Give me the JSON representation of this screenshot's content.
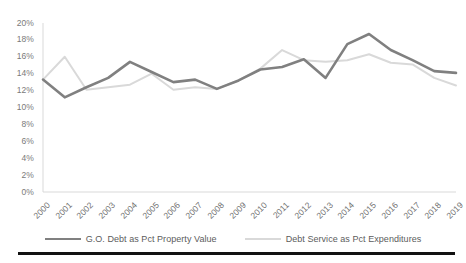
{
  "chart_data": {
    "type": "line",
    "title": "",
    "subtitle": "",
    "xlabel": "",
    "ylabel": "",
    "categories": [
      "2000",
      "2001",
      "2002",
      "2003",
      "2004",
      "2005",
      "2006",
      "2007",
      "2008",
      "2009",
      "2010",
      "2011",
      "2012",
      "2013",
      "2014",
      "2015",
      "2016",
      "2017",
      "2018",
      "2019"
    ],
    "x_tick_labels": [
      "2000",
      "2001",
      "2002",
      "2003",
      "2004",
      "2005",
      "2006",
      "2007",
      "2008",
      "2009",
      "2010",
      "2011",
      "2012",
      "2013",
      "2014",
      "2015",
      "2016",
      "2017",
      "2018",
      "2019"
    ],
    "y_tick_labels": [
      "20%",
      "18%",
      "16%",
      "14%",
      "12%",
      "10%",
      "8%",
      "6%",
      "4%",
      "2%",
      "0%"
    ],
    "y_tick_values": [
      20,
      18,
      16,
      14,
      12,
      10,
      8,
      6,
      4,
      2,
      0
    ],
    "ylim": [
      0,
      20
    ],
    "y_unit": "%",
    "y_tick_step": 2,
    "grid": false,
    "legend_position": "bottom",
    "series": [
      {
        "name": "G.O. Debt as Pct Property Value",
        "color": "#808080",
        "width": 2.6,
        "values": [
          13.3,
          11.2,
          12.4,
          13.5,
          15.4,
          14.2,
          13.0,
          13.3,
          12.2,
          13.2,
          14.5,
          14.8,
          15.7,
          13.5,
          17.5,
          18.7,
          16.8,
          15.6,
          14.3,
          14.1
        ]
      },
      {
        "name": "Debt Service as Pct Expenditures",
        "color": "#d9d9d9",
        "width": 2.0,
        "values": [
          13.3,
          16.0,
          12.1,
          12.4,
          12.7,
          14.0,
          12.1,
          12.4,
          12.2,
          13.2,
          14.6,
          16.8,
          15.6,
          15.4,
          15.6,
          16.3,
          15.3,
          15.1,
          13.5,
          12.6
        ]
      }
    ]
  },
  "legend": {
    "items": [
      {
        "label": "G.O. Debt as Pct Property Value",
        "color": "#808080"
      },
      {
        "label": "Debt Service as Pct Expenditures",
        "color": "#d9d9d9"
      }
    ]
  },
  "axes": {
    "y_axis_line_color": "#d9d9d9",
    "x_axis_line_color": "#d9d9d9"
  }
}
